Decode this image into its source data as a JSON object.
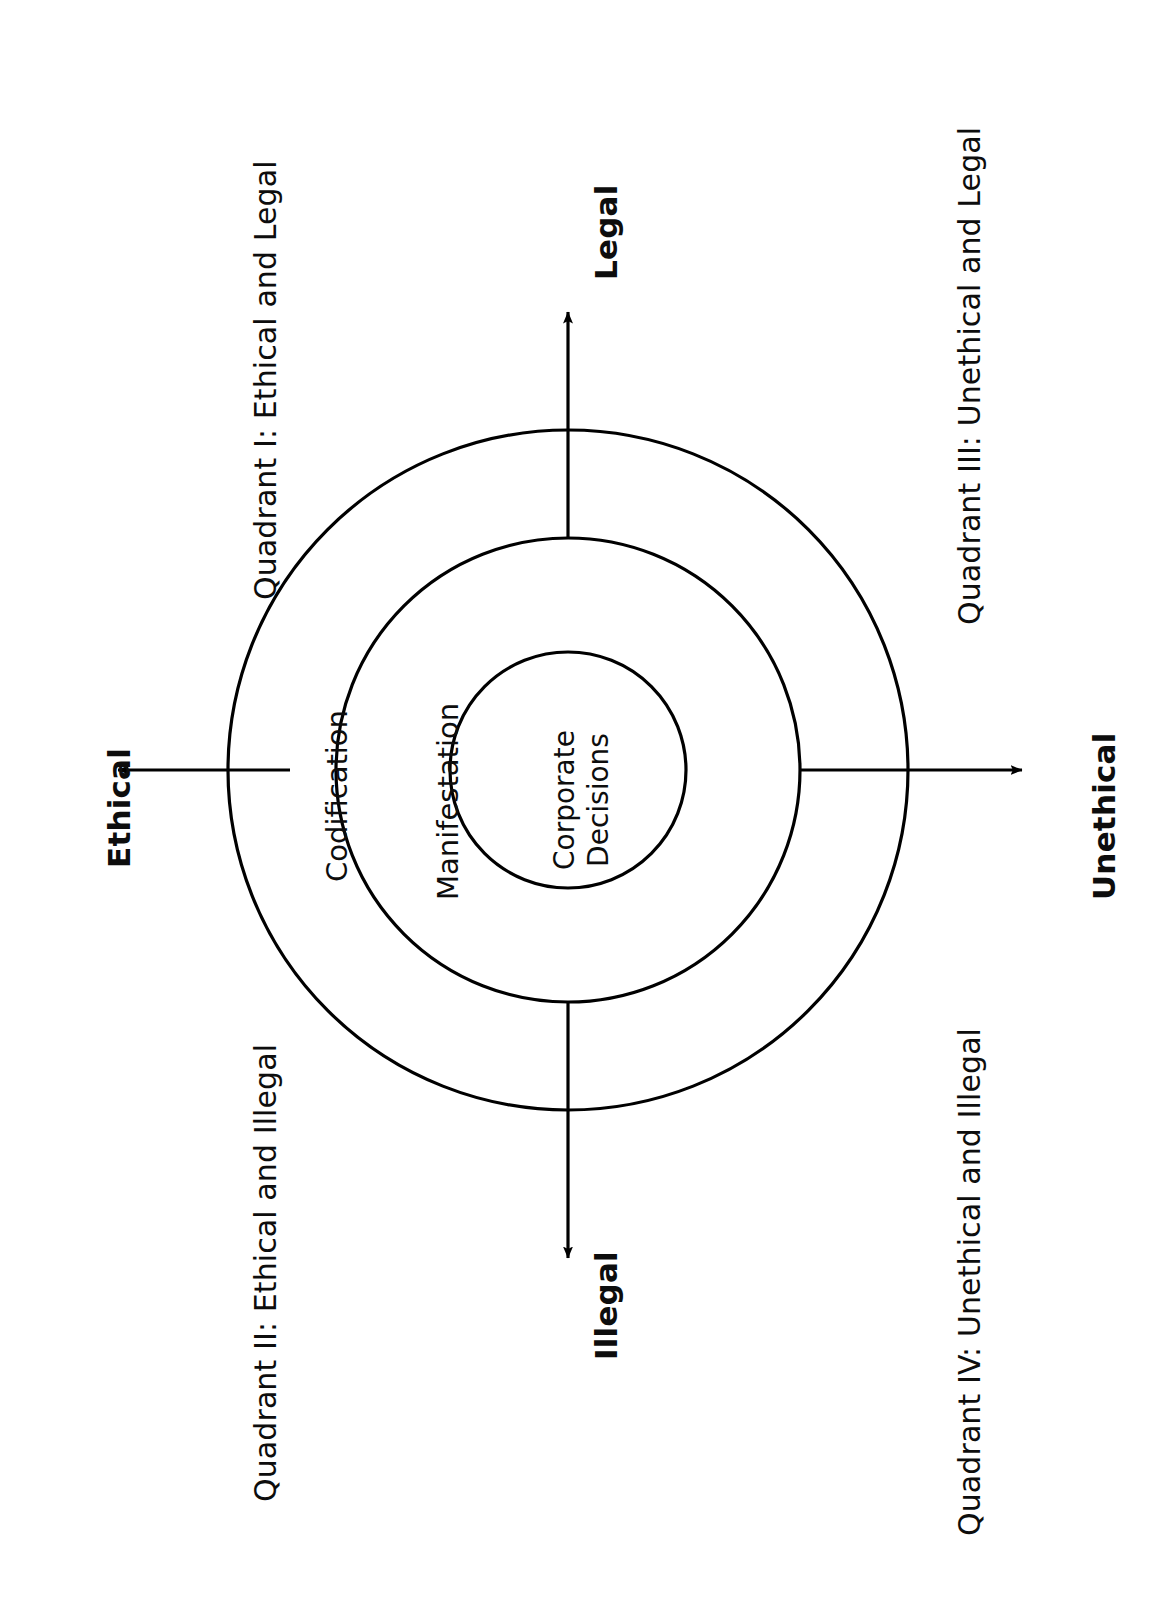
{
  "diagram": {
    "type": "concentric-quadrant-model",
    "orientation": "page rotated 90 degrees counter-clockwise; all text reads bottom-to-top",
    "background_color": "#ffffff",
    "stroke_color": "#000000",
    "text_color": "#0d0d0d",
    "center": {
      "label_line_1": "Corporate",
      "label_line_2": "Decisions"
    },
    "rings": [
      {
        "name": "inner-ring",
        "label": "Corporate Decisions",
        "radius": 118
      },
      {
        "name": "middle-ring",
        "label": "Manifestation",
        "radius": 232
      },
      {
        "name": "outer-ring",
        "label": "Codification",
        "radius": 340
      }
    ],
    "ring_labels": {
      "outer": "Codification",
      "middle": "Manifestation",
      "inner": "Corporate Decisions"
    },
    "axes": [
      {
        "name": "legal-axis",
        "label": "Legal",
        "direction": "up",
        "bold": true
      },
      {
        "name": "illegal-axis",
        "label": "Illegal",
        "direction": "down",
        "bold": true
      },
      {
        "name": "ethical-axis",
        "label": "Ethical",
        "direction": "left",
        "bold": true
      },
      {
        "name": "unethical-axis",
        "label": "Unethical",
        "direction": "right",
        "bold": true
      }
    ],
    "axis_labels": {
      "legal": "Legal",
      "illegal": "Illegal",
      "ethical": "Ethical",
      "unethical": "Unethical"
    },
    "quadrants": [
      {
        "id": "I",
        "label": "Quadrant I: Ethical and Legal",
        "position": "top-left"
      },
      {
        "id": "II",
        "label": "Quadrant II: Ethical and Illegal",
        "position": "bottom-left"
      },
      {
        "id": "III",
        "label": "Quadrant III: Unethical and Legal",
        "position": "top-right"
      },
      {
        "id": "IV",
        "label": "Quadrant IV: Unethical and Illegal",
        "position": "bottom-right"
      }
    ],
    "quadrant_labels": {
      "q1": "Quadrant I: Ethical and Legal",
      "q2": "Quadrant II: Ethical and Illegal",
      "q3": "Quadrant III: Unethical and Legal",
      "q4": "Quadrant IV: Unethical and Illegal"
    }
  }
}
